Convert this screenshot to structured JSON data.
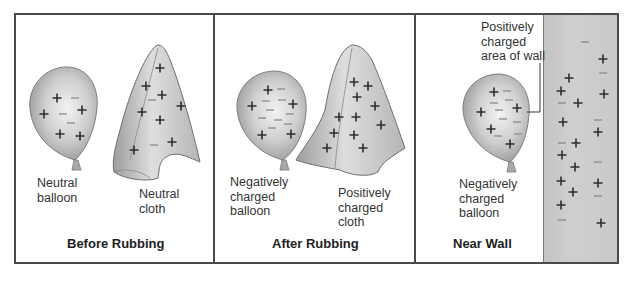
{
  "figure": {
    "panels": [
      {
        "title": "Before Rubbing",
        "labels": [
          "Neutral\nballoon",
          "Neutral\ncloth"
        ]
      },
      {
        "title": "After Rubbing",
        "labels": [
          "Negatively\ncharged\nballoon",
          "Positively\ncharged\ncloth"
        ]
      },
      {
        "title": "Near Wall",
        "labels": [
          "Negatively\ncharged\nballoon",
          "Positively\ncharged\narea of wall"
        ]
      }
    ],
    "symbols": {
      "positive": "+",
      "negative": "−"
    },
    "colors": {
      "border": "#4a4a4a",
      "balloon": "#bdbdbd",
      "cloth": "#c6c6c6",
      "wall": "#c9c9c9",
      "charge": "#2e2e2e"
    }
  }
}
